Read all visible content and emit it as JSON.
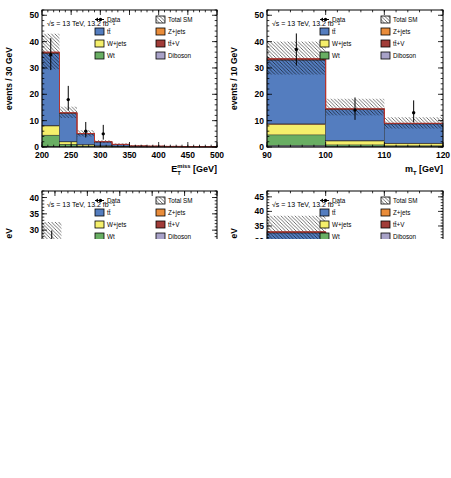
{
  "lumi_label": "√s = 13 TeV, 13.2 fb⁻¹",
  "ratio_ylabel": "Data / MC",
  "colors": {
    "ttbar": "#547dbf",
    "wjets": "#f5ef6b",
    "wt": "#69ae63",
    "zjets": "#e98c3a",
    "ttv": "#a13c38",
    "diboson": "#a8a2c8",
    "total_outline": "#b5342e",
    "ratio_line": "#e03030",
    "ratio_band": "#8ba58a",
    "hatch": "#000000",
    "frame": "#000000"
  },
  "legend": {
    "entries": [
      {
        "label": "Data",
        "swatch": "marker"
      },
      {
        "label": "Total SM",
        "swatch": "hatch"
      },
      {
        "label": "tt̄",
        "swatch": "fill",
        "color_key": "ttbar"
      },
      {
        "label": "Z+jets",
        "swatch": "fill",
        "color_key": "zjets"
      },
      {
        "label": "W+jets",
        "swatch": "fill",
        "color_key": "wjets"
      },
      {
        "label": "tt̄+V",
        "swatch": "fill",
        "color_key": "ttv"
      },
      {
        "label": "Wt",
        "swatch": "fill",
        "color_key": "wt"
      },
      {
        "label": "Diboson",
        "swatch": "fill",
        "color_key": "diboson"
      }
    ]
  },
  "chart_data": [
    {
      "id": "top-left",
      "type": "bar",
      "title": "",
      "ylabel": "events / 30 GeV",
      "xlabel_kind": "etmiss",
      "xlabel_unit": " [GeV]",
      "xlim": [
        200,
        500
      ],
      "xticks": [
        200,
        250,
        300,
        350,
        400,
        450,
        500
      ],
      "xminor": 10,
      "ylim": [
        0,
        52
      ],
      "yticks": [
        0,
        10,
        20,
        30,
        40,
        50
      ],
      "yminor": 2,
      "bin_edges": [
        200,
        230,
        260,
        290,
        320,
        350,
        380,
        410,
        440,
        470,
        500
      ],
      "series": [
        {
          "name": "Diboson",
          "color_key": "diboson",
          "values": [
            0.3,
            0.15,
            0.1,
            0.05,
            0.05,
            0.02,
            0.02,
            0.02,
            0.02,
            0.02
          ]
        },
        {
          "name": "Wt",
          "color_key": "wt",
          "values": [
            4.2,
            0.9,
            0.3,
            0.15,
            0.1,
            0.03,
            0.03,
            0.03,
            0.02,
            0.02
          ]
        },
        {
          "name": "W+jets",
          "color_key": "wjets",
          "values": [
            3.5,
            0.9,
            0.5,
            0.2,
            0.15,
            0.05,
            0.05,
            0.03,
            0.03,
            0.02
          ]
        },
        {
          "name": "Z+jets",
          "color_key": "zjets",
          "values": [
            0.2,
            0.1,
            0.05,
            0.05,
            0.03,
            0.02,
            0.02,
            0.02,
            0.01,
            0.01
          ]
        },
        {
          "name": "tt̄",
          "color_key": "ttbar",
          "values": [
            27.3,
            10.7,
            4.0,
            1.45,
            0.62,
            0.23,
            0.18,
            0.1,
            0.07,
            0.05
          ]
        },
        {
          "name": "tt̄+V",
          "color_key": "ttv",
          "values": [
            0.5,
            0.25,
            0.15,
            0.1,
            0.05,
            0.05,
            0.04,
            0.03,
            0.02,
            0.02
          ]
        }
      ],
      "total_sm_band": [
        [
          29.5,
          43
        ],
        [
          11,
          15.3
        ],
        [
          4,
          6.4
        ],
        [
          1.5,
          2.6
        ],
        [
          0.6,
          1.45
        ],
        [
          0.1,
          0.75
        ],
        [
          0.08,
          0.6
        ],
        [
          0.05,
          0.45
        ],
        [
          0.03,
          0.35
        ],
        [
          0.02,
          0.3
        ]
      ],
      "data_points": [
        [
          215,
          35,
          29.2,
          41.3
        ],
        [
          245,
          18,
          13.9,
          23.2
        ],
        [
          275,
          6,
          3.6,
          9.5
        ],
        [
          305,
          5,
          2.8,
          8.4
        ]
      ],
      "ratio": {
        "ylim": [
          0,
          2
        ],
        "yticks": [
          0,
          0.5,
          1,
          1.5,
          2
        ],
        "yminor": 0.1,
        "band": [
          [
            0.88,
            1.12
          ],
          [
            0.82,
            1.18
          ],
          [
            0.62,
            1.38
          ],
          [
            0.68,
            1.32
          ],
          [
            0.6,
            1.4
          ],
          [
            0.1,
            1.9
          ],
          [
            0.3,
            1.7
          ],
          [
            0.1,
            1.9
          ],
          [
            0.1,
            1.9
          ],
          [
            0.1,
            1.9
          ]
        ],
        "points": [
          [
            215,
            0.97,
            0.81,
            1.15
          ],
          [
            245,
            1.38,
            1.07,
            1.78
          ],
          [
            275,
            1.15,
            0.68,
            1.8
          ],
          [
            455,
            1.9,
            1.45,
            2.0
          ]
        ]
      }
    },
    {
      "id": "top-right",
      "type": "bar",
      "title": "",
      "ylabel": "events / 10 GeV",
      "xlabel_kind": "mt",
      "xlabel_unit": " [GeV]",
      "xlim": [
        90,
        120
      ],
      "xticks": [
        90,
        100,
        110,
        120
      ],
      "xminor": 2,
      "ylim": [
        0,
        52
      ],
      "yticks": [
        0,
        10,
        20,
        30,
        40,
        50
      ],
      "yminor": 2,
      "bin_edges": [
        90,
        100,
        110,
        120
      ],
      "series": [
        {
          "name": "Diboson",
          "color_key": "diboson",
          "values": [
            0.6,
            0.25,
            0.2
          ]
        },
        {
          "name": "Wt",
          "color_key": "wt",
          "values": [
            4.0,
            0.55,
            0.25
          ]
        },
        {
          "name": "W+jets",
          "color_key": "wjets",
          "values": [
            3.9,
            1.5,
            0.9
          ]
        },
        {
          "name": "Z+jets",
          "color_key": "zjets",
          "values": [
            0.3,
            0.15,
            0.1
          ]
        },
        {
          "name": "tt̄",
          "color_key": "ttbar",
          "values": [
            24.2,
            11.7,
            7.3
          ]
        },
        {
          "name": "tt̄+V",
          "color_key": "ttv",
          "values": [
            0.5,
            0.35,
            0.25
          ]
        }
      ],
      "total_sm_band": [
        [
          27.5,
          40
        ],
        [
          12,
          18.3
        ],
        [
          7,
          11.3
        ]
      ],
      "data_points": [
        [
          95,
          37,
          30.9,
          43.1
        ],
        [
          105,
          14,
          10.3,
          18.8
        ],
        [
          115,
          13,
          9.4,
          17.7
        ]
      ],
      "ratio": {
        "ylim": [
          0,
          2
        ],
        "yticks": [
          0,
          0.5,
          1,
          1.5,
          2
        ],
        "yminor": 0.1,
        "band": [
          [
            0.85,
            1.17
          ],
          [
            0.8,
            1.24
          ],
          [
            0.75,
            1.3
          ]
        ],
        "points": [
          [
            95,
            1.12,
            0.93,
            1.3
          ],
          [
            105,
            0.97,
            0.71,
            1.3
          ],
          [
            115,
            1.5,
            1.08,
            1.97
          ]
        ]
      }
    },
    {
      "id": "bottom-left",
      "type": "bar",
      "title": "",
      "ylabel": "events / 30 GeV",
      "xlabel_kind": "etmiss",
      "xlabel_unit": " [GeV]",
      "xlim": [
        230,
        500
      ],
      "xticks": [
        250,
        300,
        350,
        400,
        450,
        500
      ],
      "xminor": 10,
      "ylim": [
        0,
        42
      ],
      "yticks": [
        0,
        5,
        10,
        15,
        20,
        25,
        30,
        35,
        40
      ],
      "yminor": 1,
      "bin_edges": [
        230,
        260,
        290,
        320,
        350,
        380,
        410,
        440,
        470,
        500
      ],
      "series": [
        {
          "name": "Diboson",
          "color_key": "diboson",
          "values": [
            1.2,
            0.3,
            0.2,
            0.15,
            0.08,
            0.05,
            0.04,
            0.03,
            0.03
          ]
        },
        {
          "name": "Wt",
          "color_key": "wt",
          "values": [
            1.0,
            0.3,
            0.15,
            0.1,
            0.05,
            0.03,
            0.02,
            0.02,
            0.02
          ]
        },
        {
          "name": "W+jets",
          "color_key": "wjets",
          "values": [
            21.5,
            11.5,
            4.6,
            3.2,
            0.8,
            0.55,
            0.35,
            0.3,
            0.2
          ]
        },
        {
          "name": "Z+jets",
          "color_key": "zjets",
          "values": [
            0.3,
            0.15,
            0.1,
            0.05,
            0.03,
            0.02,
            0.02,
            0.01,
            0.01
          ]
        },
        {
          "name": "tt̄",
          "color_key": "ttbar",
          "values": [
            2.2,
            2.0,
            0.85,
            0.4,
            0.2,
            0.1,
            0.08,
            0.05,
            0.04
          ]
        },
        {
          "name": "tt̄+V",
          "color_key": "ttv",
          "values": [
            0.3,
            0.15,
            0.1,
            0.1,
            0.04,
            0.05,
            0.04,
            0.04,
            0.03
          ]
        }
      ],
      "total_sm_band": [
        [
          21,
          32.5
        ],
        [
          11.7,
          17.2
        ],
        [
          4.3,
          8.2
        ],
        [
          2.9,
          5.2
        ],
        [
          0.7,
          1.8
        ],
        [
          0.4,
          1.3
        ],
        [
          0.25,
          0.95
        ],
        [
          0.2,
          0.8
        ],
        [
          0.12,
          0.6
        ]
      ],
      "data_points": [
        [
          245,
          24.5,
          19.7,
          29.9
        ],
        [
          275,
          7,
          4.5,
          10.6
        ],
        [
          305,
          6,
          3.6,
          9.5
        ],
        [
          335,
          3.5,
          1.7,
          6.4
        ],
        [
          365,
          4,
          2.1,
          7.0
        ],
        [
          395,
          1,
          0.2,
          3.3
        ]
      ],
      "ratio": {
        "ylim": [
          0,
          2
        ],
        "yticks": [
          0,
          0.5,
          1,
          1.5,
          2
        ],
        "yminor": 0.1,
        "band": [
          [
            0.82,
            1.2
          ],
          [
            0.8,
            1.2
          ],
          [
            0.6,
            1.4
          ],
          [
            0.62,
            1.35
          ],
          [
            0.68,
            1.48
          ],
          [
            0.45,
            1.6
          ],
          [
            0.35,
            1.7
          ],
          [
            0.15,
            1.85
          ],
          [
            0.1,
            1.9
          ]
        ],
        "points": [
          [
            245,
            0.88,
            0.68,
            1.1
          ],
          [
            275,
            0.5,
            0.31,
            0.74
          ],
          [
            305,
            1.1,
            0.57,
            1.66
          ],
          [
            335,
            0.82,
            0.38,
            1.4
          ],
          [
            365,
            1.5,
            0.85,
            2.0
          ],
          [
            395,
            1.35,
            0.4,
            2.0
          ]
        ]
      }
    },
    {
      "id": "bottom-right",
      "type": "bar",
      "title": "",
      "ylabel": "events / 10 GeV",
      "xlabel_kind": "mt",
      "xlabel_unit": " [GeV]",
      "xlim": [
        90,
        120
      ],
      "xticks": [
        90,
        100,
        110,
        120
      ],
      "xminor": 2,
      "ylim": [
        0,
        47
      ],
      "yticks": [
        0,
        5,
        10,
        15,
        20,
        25,
        30,
        35,
        40,
        45
      ],
      "yminor": 1,
      "bin_edges": [
        90,
        100,
        110,
        120
      ],
      "series": [
        {
          "name": "Diboson",
          "color_key": "diboson",
          "values": [
            2.0,
            0.9,
            0.9
          ]
        },
        {
          "name": "Wt",
          "color_key": "wt",
          "values": [
            1.0,
            0.3,
            0.2
          ]
        },
        {
          "name": "W+jets",
          "color_key": "wjets",
          "values": [
            26.3,
            9.7,
            5.9
          ]
        },
        {
          "name": "Z+jets",
          "color_key": "zjets",
          "values": [
            0.3,
            0.15,
            0.1
          ]
        },
        {
          "name": "tt̄",
          "color_key": "ttbar",
          "values": [
            3.0,
            1.5,
            1.0
          ]
        },
        {
          "name": "tt̄+V",
          "color_key": "ttv",
          "values": [
            0.4,
            0.15,
            0.1
          ]
        }
      ],
      "total_sm_band": [
        [
          28,
          38.5
        ],
        [
          10,
          15.5
        ],
        [
          5,
          12
        ]
      ],
      "data_points": [
        [
          95,
          19,
          14.7,
          24.4
        ],
        [
          105,
          11,
          7.8,
          15.4
        ],
        [
          115,
          14,
          10.3,
          18.8
        ]
      ],
      "ratio": {
        "ylim": [
          0,
          2
        ],
        "yticks": [
          0,
          0.5,
          1,
          1.5,
          2
        ],
        "yminor": 0.1,
        "band": [
          [
            0.85,
            1.17
          ],
          [
            0.78,
            1.25
          ],
          [
            0.55,
            1.5
          ]
        ],
        "points": [
          [
            95,
            0.58,
            0.44,
            0.74
          ],
          [
            105,
            0.88,
            0.62,
            1.22
          ],
          [
            115,
            1.73,
            1.27,
            2.0
          ]
        ]
      }
    }
  ]
}
